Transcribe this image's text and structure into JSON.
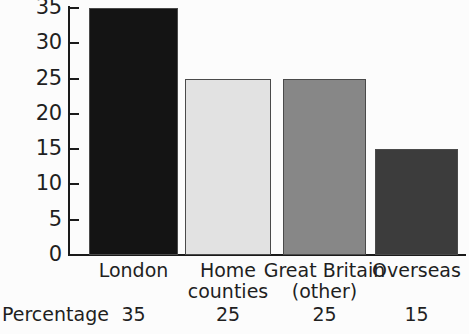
{
  "chart_data": {
    "type": "bar",
    "title": "",
    "subtitle": "",
    "xlabel": "",
    "ylabel": "",
    "categories": [
      "London",
      "Home counties",
      "Great Britain (other)",
      "Overseas"
    ],
    "category_lines": [
      [
        "London"
      ],
      [
        "Home",
        "counties"
      ],
      [
        "Great Britain",
        "(other)"
      ],
      [
        "Overseas"
      ]
    ],
    "values": [
      35,
      25,
      25,
      15
    ],
    "value_labels": [
      "35",
      "25",
      "25",
      "15"
    ],
    "ylim": [
      0,
      35
    ],
    "y_ticks": [
      0,
      5,
      10,
      15,
      20,
      25,
      30,
      35
    ],
    "y_tick_labels": [
      "0",
      "5",
      "10",
      "15",
      "20",
      "25",
      "30",
      "35"
    ],
    "grid": false,
    "legend": null,
    "legend_position": "none",
    "bar_colors": [
      "#141414",
      "#e2e2e2",
      "#878787",
      "#3c3c3c"
    ],
    "bar_edge_color": "#4a4a4a",
    "axis_color": "#1a1a1a"
  },
  "table": {
    "row_header": "Percentage",
    "values": [
      "35",
      "25",
      "25",
      "15"
    ]
  },
  "figure": {
    "background": "#fcfcfc"
  }
}
